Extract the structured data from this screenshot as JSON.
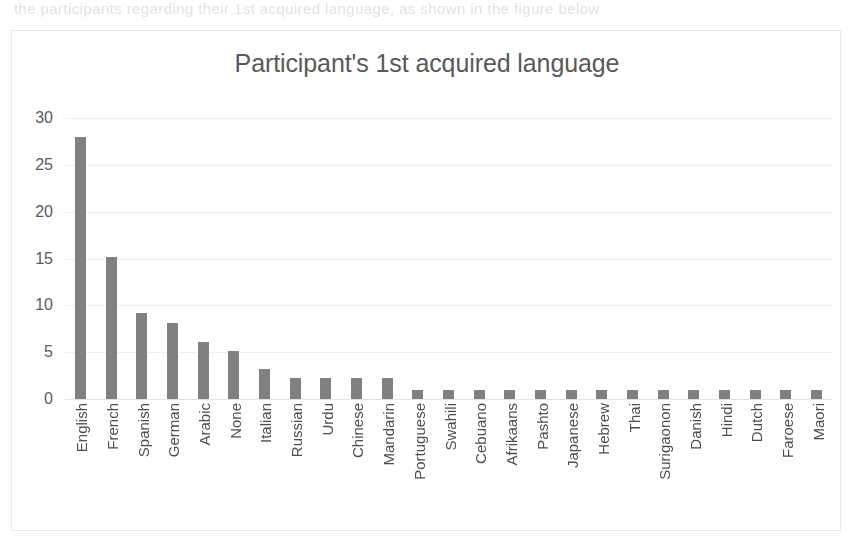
{
  "page": {
    "bleed_text": "the participants regarding their 1st acquired language, as shown in the figure below"
  },
  "chart_data": {
    "type": "bar",
    "title": "Participant's 1st acquired language",
    "xlabel": "",
    "ylabel": "",
    "ylim": [
      0,
      30
    ],
    "yticks": [
      0,
      5,
      10,
      15,
      20,
      25,
      30
    ],
    "grid": true,
    "legend": false,
    "bar_color": "#808080",
    "gridline_color": "#eeeeee",
    "title_color": "#595959",
    "tick_label_color": "#4d4d4d",
    "categories": [
      "English",
      "French",
      "Spanish",
      "German",
      "Arabic",
      "None",
      "Italian",
      "Russian",
      "Urdu",
      "Chinese",
      "Mandarin",
      "Portuguese",
      "Swahili",
      "Cebuano",
      "Afrikaans",
      "Pashto",
      "Japanese",
      "Hebrew",
      "Thai",
      "Surigaonon",
      "Danish",
      "Hindi",
      "Dutch",
      "Faroese",
      "Maori"
    ],
    "values": [
      28,
      15.2,
      9.2,
      8.1,
      6.1,
      5.1,
      3.2,
      2.2,
      2.2,
      2.2,
      2.2,
      1,
      1,
      1,
      1,
      1,
      1,
      1,
      1,
      1,
      1,
      1,
      1,
      1,
      1
    ]
  }
}
